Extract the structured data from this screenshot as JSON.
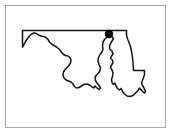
{
  "figure": {
    "kind": "state-outline-map",
    "background_color": "#ffffff",
    "frame": {
      "visible": true,
      "border_color": "#a8a8a8",
      "border_width_px": 1,
      "x": 5,
      "y": 5,
      "width": 161,
      "height": 123
    },
    "outline": {
      "stroke_color": "#141414",
      "stroke_width_px": 1.5,
      "fill": "none",
      "description": "Black line drawing of the state boundary: straight Mason-Dixon line along the north, narrow western panhandle tapering to a point at the far west, irregular southern Potomac River border, Chesapeake Bay inlet cutting up into the middle, vertical Delaware border on the east, and the Eastern Shore with the notched Atlantic coast at the southeast."
    },
    "markers": [
      {
        "name": "city-dot",
        "shape": "filled-circle",
        "color": "#050505",
        "x": 109,
        "y": 34,
        "radius": 4.2
      }
    ],
    "labels": [],
    "legend": {
      "visible": false,
      "entries": []
    },
    "title": "",
    "caption": ""
  },
  "geometry": {
    "state_outline_path": "M 22.5,30.5 L 126.5,30.5 L 126.5,35.5 L 128.0,40.0 L 130.5,46.5 L 132.0,54.0 L 133.0,62.0 L 133.5,70.5 L 140.0,70.5 L 144.5,70.5 L 144.5,74.5 L 143.0,79.0 L 141.5,83.0 L 142.5,85.5 L 144.0,88.0 L 145.5,91.5 L 144.5,93.0 L 142.0,91.0 L 139.5,88.0 L 138.0,90.5 L 135.5,93.0 L 133.0,95.5 L 130.0,96.5 L 127.0,96.0 L 124.5,94.0 L 122.5,91.5 L 121.0,88.5 L 119.5,90.0 L 117.5,88.5 L 116.0,86.0 L 115.0,83.0 L 113.5,84.5 L 112.0,82.5 L 111.5,79.5 L 112.5,76.5 L 113.0,73.0 L 112.0,70.0 L 110.5,67.5 L 111.5,65.0 L 113.0,63.0 L 112.5,60.0 L 110.5,58.5 L 111.5,56.0 L 113.0,54.0 L 112.0,51.0 L 110.0,49.5 L 109.5,46.5 L 110.5,43.5 L 112.0,41.0 L 113.5,38.5 L 112.0,36.5 L 109.0,36.0 L 106.5,37.5 L 104.5,39.5 L 103.0,42.0 L 102.5,45.5 L 103.0,49.0 L 102.0,52.0 L 100.0,54.5 L 98.5,57.5 L 98.0,61.0 L 99.0,64.5 L 100.5,67.5 L 100.0,70.5 L 98.5,73.0 L 96.5,75.0 L 95.0,77.5 L 95.5,80.5 L 97.0,83.0 L 99.0,85.5 L 100.5,88.0 L 99.0,89.5 L 97.0,88.0 L 95.0,86.0 L 93.5,88.0 L 91.5,86.5 L 89.5,85.0 L 87.0,84.0 L 84.0,84.5 L 81.5,86.0 L 79.0,87.5 L 76.5,88.0 L 74.5,86.5 L 73.0,84.0 L 71.0,82.0 L 68.5,81.0 L 66.0,80.0 L 64.0,78.0 L 63.0,75.0 L 63.5,72.0 L 65.0,69.5 L 67.0,67.5 L 69.0,65.5 L 70.5,63.0 L 71.0,60.0 L 70.0,57.5 L 68.0,56.0 L 65.5,55.5 L 63.0,54.0 L 61.0,51.5 L 59.0,49.0 L 56.5,47.0 L 54.0,45.5 L 51.5,44.0 L 49.5,42.0 L 48.0,39.5 L 46.0,37.5 L 43.5,36.5 L 41.0,36.0 L 38.5,35.0 L 36.5,33.5 L 34.0,33.0 L 31.5,34.0 L 29.5,36.0 L 27.5,38.5 L 25.5,41.5 L 24.0,44.5 L 22.5,47.0 L 22.5,30.5 Z",
    "viewbox": "0 0 172 134"
  }
}
